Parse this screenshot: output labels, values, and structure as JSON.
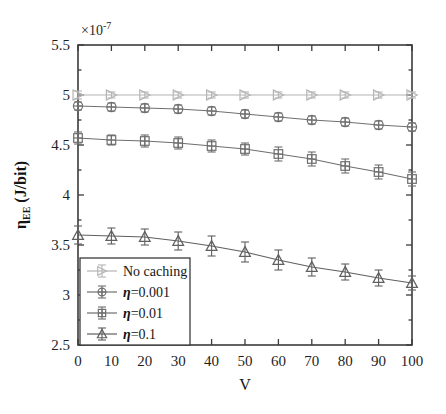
{
  "chart_data": {
    "type": "line",
    "title": "",
    "subtitle": "",
    "xlabel": "V",
    "ylabel": "ηEE (J/bit)",
    "ylabel_base": "η",
    "ylabel_sub": "EE",
    "ylabel_unit": " (J/bit)",
    "y_exponent_label": "×10",
    "y_exponent_power": "-7",
    "y_scale": 1e-07,
    "xlim": [
      0,
      100
    ],
    "ylim": [
      2.5,
      5.5
    ],
    "xticks": [
      0,
      10,
      20,
      30,
      40,
      50,
      60,
      70,
      80,
      90,
      100
    ],
    "xticklabels": [
      "0",
      "10",
      "20",
      "30",
      "40",
      "50",
      "60",
      "70",
      "80",
      "90",
      "100"
    ],
    "yticks": [
      2.5,
      3,
      3.5,
      4,
      4.5,
      5,
      5.5
    ],
    "yticklabels": [
      "2.5",
      "3",
      "3.5",
      "4",
      "4.5",
      "5",
      "5.5"
    ],
    "grid": false,
    "legend_position": "lower left",
    "x": [
      0,
      10,
      20,
      30,
      40,
      50,
      60,
      70,
      80,
      90,
      100
    ],
    "series": [
      {
        "name": "No caching",
        "marker": "right-triangle",
        "color": "#b4b4b4",
        "values": [
          5.0,
          5.0,
          5.0,
          5.0,
          5.0,
          5.0,
          5.0,
          5.0,
          5.0,
          5.0,
          5.0
        ],
        "errors": [
          0.04,
          0.03,
          0.03,
          0.03,
          0.03,
          0.03,
          0.03,
          0.03,
          0.03,
          0.03,
          0.03
        ]
      },
      {
        "name": "η=0.001",
        "marker": "circle-cross",
        "color": "#707070",
        "values": [
          4.89,
          4.88,
          4.87,
          4.86,
          4.84,
          4.81,
          4.78,
          4.75,
          4.73,
          4.7,
          4.68
        ],
        "errors": [
          0.04,
          0.04,
          0.04,
          0.04,
          0.04,
          0.04,
          0.04,
          0.04,
          0.04,
          0.04,
          0.04
        ]
      },
      {
        "name": "η=0.01",
        "marker": "square-cross",
        "color": "#6e6e6e",
        "values": [
          4.57,
          4.55,
          4.54,
          4.52,
          4.49,
          4.46,
          4.41,
          4.36,
          4.29,
          4.23,
          4.16
        ],
        "errors": [
          0.06,
          0.05,
          0.06,
          0.06,
          0.06,
          0.06,
          0.07,
          0.07,
          0.07,
          0.07,
          0.07
        ]
      },
      {
        "name": "η=0.1",
        "marker": "triangle",
        "color": "#5f5f5f",
        "values": [
          3.6,
          3.59,
          3.58,
          3.54,
          3.49,
          3.43,
          3.35,
          3.28,
          3.23,
          3.17,
          3.12
        ],
        "errors": [
          0.09,
          0.08,
          0.08,
          0.09,
          0.1,
          0.1,
          0.1,
          0.09,
          0.08,
          0.08,
          0.07
        ]
      }
    ],
    "legend": [
      {
        "label": "No caching",
        "marker": "right-triangle",
        "color": "#b4b4b4",
        "eta": false
      },
      {
        "label": "=0.001",
        "marker": "circle-cross",
        "color": "#707070",
        "eta": true
      },
      {
        "label": "=0.01",
        "marker": "square-cross",
        "color": "#6e6e6e",
        "eta": true
      },
      {
        "label": "=0.1",
        "marker": "triangle",
        "color": "#5f5f5f",
        "eta": true
      }
    ]
  },
  "figure": {
    "background": "#ffffff",
    "axis_color": "#3b3b3b"
  }
}
